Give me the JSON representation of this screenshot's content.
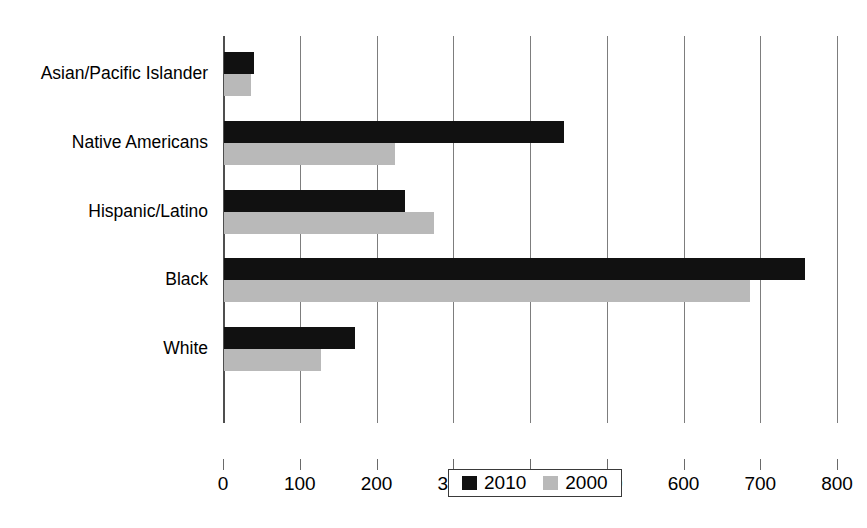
{
  "chart_data": {
    "type": "bar",
    "orientation": "horizontal",
    "title": "",
    "xlabel": "",
    "ylabel": "",
    "categories": [
      "Asian/Pacific Islander",
      "Native Americans",
      "Hispanic/Latino",
      "Black",
      "White"
    ],
    "series": [
      {
        "name": "2010",
        "color": "#111111",
        "values": [
          39,
          443,
          236,
          757,
          171
        ]
      },
      {
        "name": "2000",
        "color": "#b9b9b9",
        "values": [
          35,
          223,
          273,
          685,
          126
        ]
      }
    ],
    "xlim": [
      0,
      800
    ],
    "xticks": [
      0,
      100,
      200,
      300,
      400,
      500,
      600,
      700,
      800
    ],
    "xtick_labels": [
      "0",
      "100",
      "200",
      "300",
      "400",
      "500",
      "600",
      "700",
      "800"
    ],
    "grid": "vertical",
    "legend_position": "bottom-center",
    "legend_entries": [
      "2010",
      "2000"
    ]
  },
  "artifacts": {
    "top_clipped_text": "",
    "bottom_clipped_text": ""
  }
}
